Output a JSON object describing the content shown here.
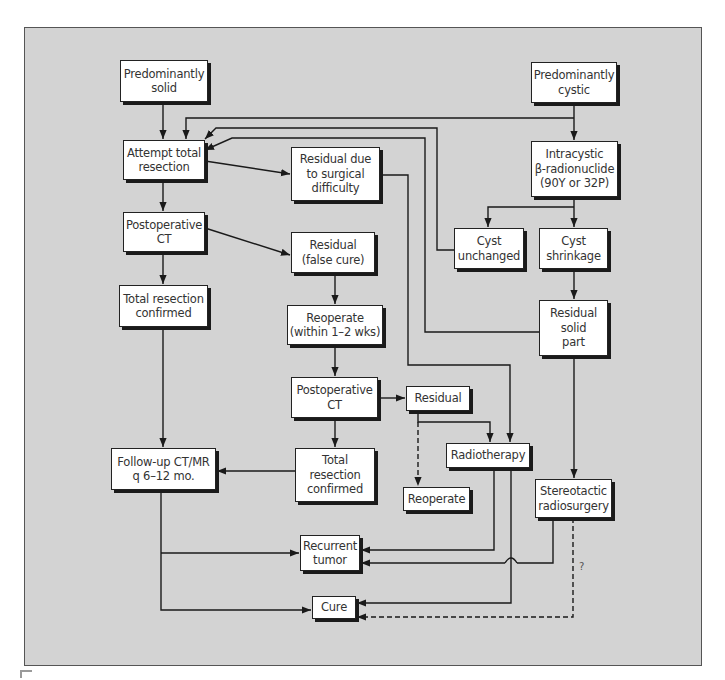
{
  "diagram": {
    "type": "flowchart",
    "colors": {
      "panel_background": "#d3d3d3",
      "node_fill": "#ffffff",
      "line": "#1a1a1a",
      "page": "#ffffff"
    },
    "nodes": {
      "pred_solid": "Predominantly\nsolid",
      "pred_cystic": "Predominantly\ncystic",
      "attempt_total_resection": "Attempt total\nresection",
      "residual_surgical": "Residual due\nto surgical\ndifficulty",
      "intracystic": "Intracystic\nβ-radionuclide\n(90Y or 32P)",
      "postop_ct_1": "Postoperative\nCT",
      "residual_false_cure": "Residual\n(false cure)",
      "cyst_unchanged": "Cyst\nunchanged",
      "cyst_shrinkage": "Cyst\nshrinkage",
      "total_resection_confirmed_1": "Total resection\nconfirmed",
      "reoperate_1_2_wks": "Reoperate\n(within 1–2 wks)",
      "residual_solid_part": "Residual\nsolid\npart",
      "postop_ct_2": "Postoperative\nCT",
      "residual_2": "Residual",
      "followup": "Follow-up CT/MR\nq 6–12 mo.",
      "total_resection_confirmed_2": "Total\nresection\nconfirmed",
      "radiotherapy": "Radiotherapy",
      "reoperate_2": "Reoperate",
      "stereotactic": "Stereotactic\nradiosurgery",
      "recurrent_tumor": "Recurrent\ntumor",
      "cure": "Cure"
    },
    "annotations": {
      "uncertain_mark": "?"
    },
    "edges": [
      {
        "from": "pred_solid",
        "to": "attempt_total_resection",
        "style": "solid"
      },
      {
        "from": "pred_cystic",
        "to": "intracystic",
        "style": "solid"
      },
      {
        "from": "pred_cystic",
        "to": "attempt_total_resection",
        "style": "solid"
      },
      {
        "from": "attempt_total_resection",
        "to": "residual_surgical",
        "style": "solid"
      },
      {
        "from": "attempt_total_resection",
        "to": "postop_ct_1",
        "style": "solid"
      },
      {
        "from": "intracystic",
        "to": "cyst_unchanged",
        "style": "solid"
      },
      {
        "from": "intracystic",
        "to": "cyst_shrinkage",
        "style": "solid"
      },
      {
        "from": "cyst_unchanged",
        "to": "attempt_total_resection",
        "style": "solid"
      },
      {
        "from": "residual_solid_part",
        "to": "attempt_total_resection",
        "style": "solid"
      },
      {
        "from": "cyst_shrinkage",
        "to": "residual_solid_part",
        "style": "solid"
      },
      {
        "from": "residual_solid_part",
        "to": "stereotactic",
        "style": "solid"
      },
      {
        "from": "postop_ct_1",
        "to": "total_resection_confirmed_1",
        "style": "solid"
      },
      {
        "from": "postop_ct_1",
        "to": "residual_false_cure",
        "style": "solid"
      },
      {
        "from": "residual_false_cure",
        "to": "reoperate_1_2_wks",
        "style": "solid"
      },
      {
        "from": "reoperate_1_2_wks",
        "to": "postop_ct_2",
        "style": "solid"
      },
      {
        "from": "postop_ct_2",
        "to": "residual_2",
        "style": "solid"
      },
      {
        "from": "postop_ct_2",
        "to": "total_resection_confirmed_2",
        "style": "solid"
      },
      {
        "from": "residual_surgical",
        "to": "radiotherapy",
        "style": "solid"
      },
      {
        "from": "residual_2",
        "to": "radiotherapy",
        "style": "solid"
      },
      {
        "from": "residual_2",
        "to": "reoperate_2",
        "style": "dashed"
      },
      {
        "from": "total_resection_confirmed_1",
        "to": "followup",
        "style": "solid"
      },
      {
        "from": "total_resection_confirmed_2",
        "to": "followup",
        "style": "solid"
      },
      {
        "from": "followup",
        "to": "recurrent_tumor",
        "style": "solid"
      },
      {
        "from": "followup",
        "to": "cure",
        "style": "solid"
      },
      {
        "from": "radiotherapy",
        "to": "recurrent_tumor",
        "style": "solid"
      },
      {
        "from": "radiotherapy",
        "to": "cure",
        "style": "solid"
      },
      {
        "from": "stereotactic",
        "to": "recurrent_tumor",
        "style": "solid"
      },
      {
        "from": "stereotactic",
        "to": "cure",
        "style": "dashed",
        "label": "?"
      }
    ]
  }
}
